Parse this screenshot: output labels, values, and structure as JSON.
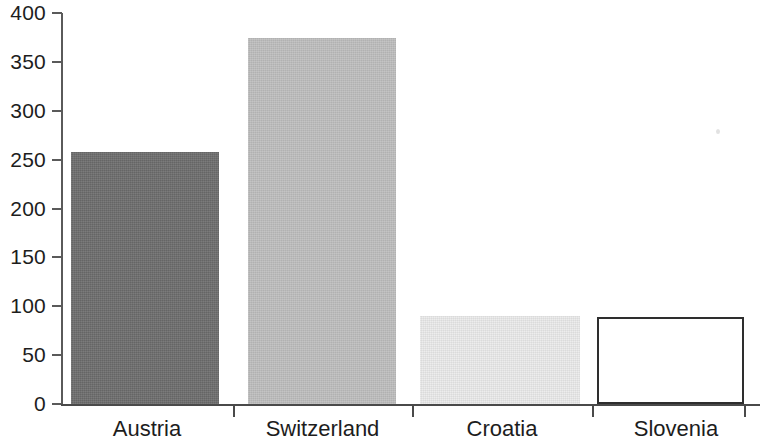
{
  "chart_data": {
    "type": "bar",
    "title": "",
    "subtitle": "",
    "xlabel": "",
    "ylabel": "",
    "categories": [
      "Austria",
      "Switzerland",
      "Croatia",
      "Slovenia"
    ],
    "values": [
      258,
      374,
      90,
      89
    ],
    "series": [
      {
        "name": "",
        "values": [
          258,
          374,
          90,
          89
        ]
      }
    ],
    "ylim": [
      0,
      400
    ],
    "yticks": [
      0,
      50,
      100,
      150,
      200,
      250,
      300,
      350,
      400
    ],
    "ytick_labels": [
      "0",
      "50",
      "100",
      "150",
      "200",
      "250",
      "300",
      "350",
      "400"
    ],
    "grid": false,
    "legend": null,
    "bar_colors": [
      "#6e6e6e",
      "#bfbfbf",
      "#ececec",
      "#ffffff"
    ],
    "bar_edge_colors": [
      "none",
      "none",
      "none",
      "#2e2e2e"
    ],
    "axis_color": "#4a4a4a",
    "background": "#ffffff",
    "annotations": []
  },
  "axes": {
    "y_ticks": [
      {
        "label": "400",
        "value": 400
      },
      {
        "label": "350",
        "value": 350
      },
      {
        "label": "300",
        "value": 300
      },
      {
        "label": "250",
        "value": 250
      },
      {
        "label": "200",
        "value": 200
      },
      {
        "label": "150",
        "value": 150
      },
      {
        "label": "100",
        "value": 100
      },
      {
        "label": "50",
        "value": 50
      },
      {
        "label": "0",
        "value": 0
      }
    ],
    "x_categories": [
      {
        "label": "Austria"
      },
      {
        "label": "Switzerland"
      },
      {
        "label": "Croatia"
      },
      {
        "label": "Slovenia"
      }
    ]
  }
}
